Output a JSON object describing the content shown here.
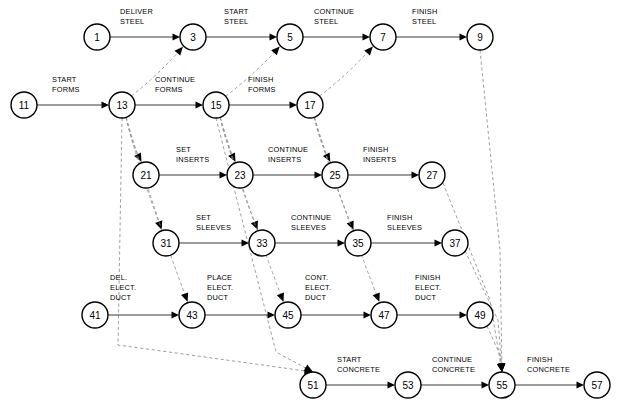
{
  "diagram": {
    "type": "activity-on-arrow-network",
    "title": "",
    "nodes": [
      {
        "id": "1",
        "label": "1",
        "x": 97,
        "y": 37
      },
      {
        "id": "3",
        "label": "3",
        "x": 193,
        "y": 37
      },
      {
        "id": "5",
        "label": "5",
        "x": 290,
        "y": 37
      },
      {
        "id": "7",
        "label": "7",
        "x": 383,
        "y": 37
      },
      {
        "id": "9",
        "label": "9",
        "x": 480,
        "y": 37
      },
      {
        "id": "11",
        "label": "11",
        "x": 24,
        "y": 105
      },
      {
        "id": "13",
        "label": "13",
        "x": 122,
        "y": 105
      },
      {
        "id": "15",
        "label": "15",
        "x": 216,
        "y": 105
      },
      {
        "id": "17",
        "label": "17",
        "x": 310,
        "y": 105
      },
      {
        "id": "21",
        "label": "21",
        "x": 146,
        "y": 175
      },
      {
        "id": "23",
        "label": "23",
        "x": 240,
        "y": 175
      },
      {
        "id": "25",
        "label": "25",
        "x": 335,
        "y": 175
      },
      {
        "id": "27",
        "label": "27",
        "x": 432,
        "y": 175
      },
      {
        "id": "31",
        "label": "31",
        "x": 166,
        "y": 243
      },
      {
        "id": "33",
        "label": "33",
        "x": 262,
        "y": 243
      },
      {
        "id": "35",
        "label": "35",
        "x": 358,
        "y": 243
      },
      {
        "id": "37",
        "label": "37",
        "x": 455,
        "y": 243
      },
      {
        "id": "41",
        "label": "41",
        "x": 95,
        "y": 315
      },
      {
        "id": "43",
        "label": "43",
        "x": 192,
        "y": 315
      },
      {
        "id": "45",
        "label": "45",
        "x": 288,
        "y": 315
      },
      {
        "id": "47",
        "label": "47",
        "x": 384,
        "y": 315
      },
      {
        "id": "49",
        "label": "49",
        "x": 480,
        "y": 315
      },
      {
        "id": "51",
        "label": "51",
        "x": 313,
        "y": 385
      },
      {
        "id": "53",
        "label": "53",
        "x": 408,
        "y": 385
      },
      {
        "id": "55",
        "label": "55",
        "x": 502,
        "y": 385
      },
      {
        "id": "57",
        "label": "57",
        "x": 597,
        "y": 385
      }
    ],
    "node_radius": 13,
    "activities": [
      {
        "from": "1",
        "to": "3",
        "label": [
          "DELIVER",
          "STEEL"
        ],
        "label_x": 120,
        "label_y": 14
      },
      {
        "from": "3",
        "to": "5",
        "label": [
          "START",
          "STEEL"
        ],
        "label_x": 224,
        "label_y": 14
      },
      {
        "from": "5",
        "to": "7",
        "label": [
          "CONTINUE",
          "STEEL"
        ],
        "label_x": 314,
        "label_y": 14
      },
      {
        "from": "7",
        "to": "9",
        "label": [
          "FINISH",
          "STEEL"
        ],
        "label_x": 412,
        "label_y": 14
      },
      {
        "from": "11",
        "to": "13",
        "label": [
          "START",
          "FORMS"
        ],
        "label_x": 52,
        "label_y": 82
      },
      {
        "from": "13",
        "to": "15",
        "label": [
          "CONTINUE",
          "FORMS"
        ],
        "label_x": 155,
        "label_y": 82
      },
      {
        "from": "15",
        "to": "17",
        "label": [
          "FINISH",
          "FORMS"
        ],
        "label_x": 248,
        "label_y": 82
      },
      {
        "from": "21",
        "to": "23",
        "label": [
          "SET",
          "INSERTS"
        ],
        "label_x": 176,
        "label_y": 152
      },
      {
        "from": "23",
        "to": "25",
        "label": [
          "CONTINUE",
          "INSERTS"
        ],
        "label_x": 268,
        "label_y": 152
      },
      {
        "from": "25",
        "to": "27",
        "label": [
          "FINISH",
          "INSERTS"
        ],
        "label_x": 363,
        "label_y": 152
      },
      {
        "from": "31",
        "to": "33",
        "label": [
          "SET",
          "SLEEVES"
        ],
        "label_x": 196,
        "label_y": 220
      },
      {
        "from": "33",
        "to": "35",
        "label": [
          "CONTINUE",
          "SLEEVES"
        ],
        "label_x": 291,
        "label_y": 220
      },
      {
        "from": "35",
        "to": "37",
        "label": [
          "FINISH",
          "SLEEVES"
        ],
        "label_x": 387,
        "label_y": 220
      },
      {
        "from": "41",
        "to": "43",
        "label": [
          "DEL.",
          "ELECT.",
          "DUCT"
        ],
        "label_x": 110,
        "label_y": 280
      },
      {
        "from": "43",
        "to": "45",
        "label": [
          "PLACE",
          "ELECT.",
          "DUCT"
        ],
        "label_x": 207,
        "label_y": 280
      },
      {
        "from": "45",
        "to": "47",
        "label": [
          "CONT.",
          "ELECT.",
          "DUCT"
        ],
        "label_x": 305,
        "label_y": 280
      },
      {
        "from": "47",
        "to": "49",
        "label": [
          "FINISH",
          "ELECT.",
          "DUCT"
        ],
        "label_x": 415,
        "label_y": 280
      },
      {
        "from": "51",
        "to": "53",
        "label": [
          "START",
          "CONCRETE"
        ],
        "label_x": 337,
        "label_y": 362
      },
      {
        "from": "53",
        "to": "55",
        "label": [
          "CONTINUE",
          "CONCRETE"
        ],
        "label_x": 432,
        "label_y": 362
      },
      {
        "from": "55",
        "to": "57",
        "label": [
          "FINISH",
          "CONCRETE"
        ],
        "label_x": 527,
        "label_y": 362
      }
    ],
    "dependencies": [
      {
        "from": "13",
        "to": "3"
      },
      {
        "from": "15",
        "to": "5"
      },
      {
        "from": "17",
        "to": "7"
      },
      {
        "from": "13",
        "to": "21"
      },
      {
        "from": "15",
        "to": "23"
      },
      {
        "from": "17",
        "to": "25"
      },
      {
        "from": "13",
        "to": "31"
      },
      {
        "from": "15",
        "to": "33"
      },
      {
        "from": "17",
        "to": "35"
      },
      {
        "from": "13",
        "to": "43"
      },
      {
        "from": "15",
        "to": "45"
      },
      {
        "from": "17",
        "to": "47"
      },
      {
        "from": "13",
        "to": "51"
      },
      {
        "from": "15",
        "to": "51"
      },
      {
        "from": "9",
        "to": "55"
      },
      {
        "from": "27",
        "to": "55"
      },
      {
        "from": "37",
        "to": "55"
      },
      {
        "from": "49",
        "to": "55"
      }
    ]
  }
}
